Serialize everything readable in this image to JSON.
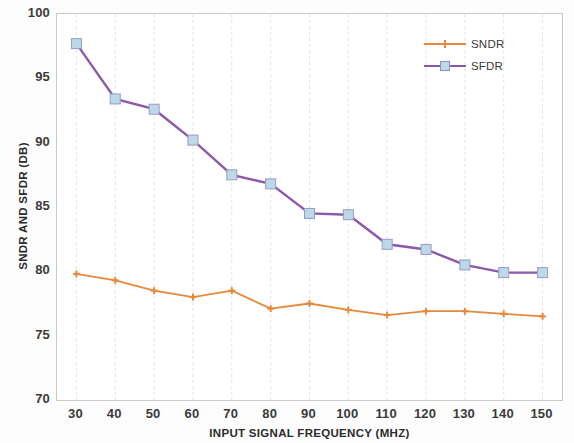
{
  "chart_data": {
    "type": "line",
    "title": "",
    "xlabel": "INPUT SIGNAL FREQUENCY (MHZ)",
    "ylabel": "SNDR AND SFDR (DB)",
    "x": [
      30,
      40,
      50,
      60,
      70,
      80,
      90,
      100,
      110,
      120,
      130,
      140,
      150
    ],
    "xtick_labels": [
      "30",
      "40",
      "50",
      "60",
      "70",
      "80",
      "90",
      "100",
      "110",
      "120",
      "130",
      "140",
      "150"
    ],
    "ytick_labels": [
      "100",
      "95",
      "90",
      "85",
      "80",
      "75",
      "70"
    ],
    "yticks": [
      100,
      95,
      90,
      85,
      80,
      75,
      70
    ],
    "xlim": [
      25,
      155
    ],
    "ylim": [
      70,
      100
    ],
    "grid": "vertical-dashed",
    "legend_position": "top-right",
    "series": [
      {
        "name": "SNDR",
        "color": "#e8883a",
        "marker": "cross",
        "values": [
          79.8,
          79.3,
          78.5,
          78.0,
          78.5,
          77.1,
          77.5,
          77.0,
          76.6,
          76.9,
          76.9,
          76.7,
          76.5
        ]
      },
      {
        "name": "SFDR",
        "color": "#8e58a8",
        "marker": "square",
        "marker_fill": "#bcd9e8",
        "values": [
          97.7,
          93.4,
          92.6,
          90.2,
          87.5,
          86.8,
          84.5,
          84.4,
          82.1,
          81.7,
          80.5,
          79.9,
          79.9
        ]
      }
    ]
  },
  "legend": {
    "items": [
      {
        "label": "SNDR"
      },
      {
        "label": "SFDR"
      }
    ]
  }
}
